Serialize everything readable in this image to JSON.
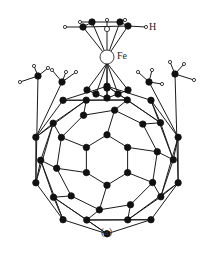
{
  "figure": {
    "caption": "(a)",
    "labels": {
      "hydrogen": "H",
      "iron": "Fe"
    },
    "colors": {
      "bond": "#1a1a1a",
      "carbon": "#111111",
      "hydrogen_fill": "#ffffff",
      "background": "#ffffff"
    }
  }
}
